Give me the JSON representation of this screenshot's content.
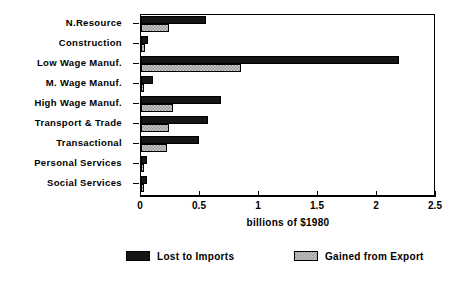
{
  "chart_data": {
    "type": "bar",
    "orientation": "horizontal",
    "title": "",
    "xlabel": "billions of $1980",
    "ylabel": "",
    "xlim": [
      0,
      2.5
    ],
    "xticks": [
      0,
      0.5,
      1,
      1.5,
      2,
      2.5
    ],
    "xtick_labels": [
      "0",
      "0.5",
      "1",
      "1.5",
      "2",
      "2.5"
    ],
    "grid": false,
    "legend_position": "bottom",
    "categories": [
      "N.Resource",
      "Construction",
      "Low Wage Manuf.",
      "M. Wage Manuf.",
      "High Wage Manuf.",
      "Transport & Trade",
      "Transactional",
      "Personal Services",
      "Social Services"
    ],
    "series": [
      {
        "name": "Lost to Imports",
        "color": "#151515",
        "values": [
          0.55,
          0.06,
          2.19,
          0.1,
          0.68,
          0.57,
          0.49,
          0.05,
          0.05
        ]
      },
      {
        "name": "Gained from Export",
        "color": "#c9c9c9",
        "values": [
          0.24,
          0.03,
          0.85,
          0.02,
          0.27,
          0.24,
          0.22,
          0.02,
          0.02
        ]
      }
    ]
  },
  "legend": {
    "entries": [
      {
        "label": "Lost to Imports"
      },
      {
        "label": "Gained from Export"
      }
    ]
  },
  "axis": {
    "x_title": "billions of $1980"
  }
}
